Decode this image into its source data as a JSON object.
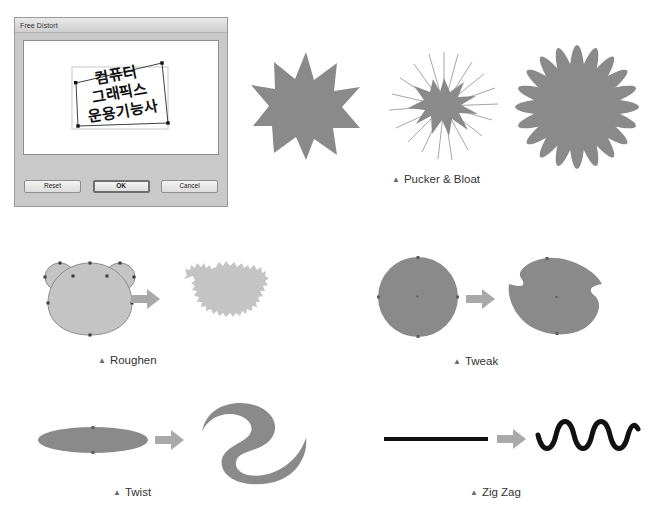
{
  "dialog": {
    "title": "Free Distort",
    "artwork_text_lines": [
      "컴퓨터",
      "그래픽스",
      "운용기능사"
    ],
    "buttons": {
      "reset": "Reset",
      "ok": "OK",
      "cancel": "Cancel"
    }
  },
  "figures": {
    "pucker_bloat": {
      "caption": "Pucker & Bloat",
      "marker": "▲",
      "samples": [
        "star-12-point",
        "pucker-spikes",
        "bloat-flower"
      ]
    },
    "roughen": {
      "caption": "Roughen",
      "marker": "▲",
      "before": "bear-head-smooth",
      "after": "bear-head-roughened",
      "arrow": "right-arrow-icon"
    },
    "tweak": {
      "caption": "Tweak",
      "marker": "▲",
      "before": "circle",
      "after": "tweaked-blob",
      "arrow": "right-arrow-icon"
    },
    "twist": {
      "caption": "Twist",
      "marker": "▲",
      "before": "ellipse",
      "after": "twisted-s-shape",
      "arrow": "right-arrow-icon"
    },
    "zigzag": {
      "caption": "Zig Zag",
      "marker": "▲",
      "before": "straight-line",
      "after": "wavy-line",
      "arrow": "right-arrow-icon"
    }
  },
  "colors": {
    "shape_gray": "#8a8a8a",
    "shape_light_gray": "#c4c4c4",
    "arrow_gray": "#a8a8a8",
    "line_black": "#111111",
    "dialog_face": "#c9c9c9"
  }
}
